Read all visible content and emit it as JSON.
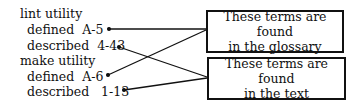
{
  "index": {
    "entries": [
      {
        "text": "lint utility",
        "x": 20,
        "y": 6
      },
      {
        "text": "defined  A-5",
        "x": 27,
        "y": 22
      },
      {
        "text": "described  4-43",
        "x": 27,
        "y": 38
      },
      {
        "text": "make utility",
        "x": 20,
        "y": 53
      },
      {
        "text": "defined  A-6",
        "x": 27,
        "y": 69
      },
      {
        "text": "described   1-13",
        "x": 27,
        "y": 84
      }
    ]
  },
  "boxes": [
    {
      "line1": "These terms are found",
      "line2": "in the glossary"
    },
    {
      "line1": "These terms are found",
      "line2": "in the text"
    }
  ]
}
